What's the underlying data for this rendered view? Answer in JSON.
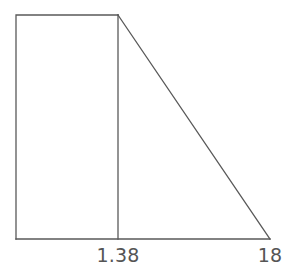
{
  "figure": {
    "name": "pressure-distribution-diagram",
    "background_color": "#ffffff",
    "line_color": "#595959",
    "line_width": 1.3,
    "label_color": "#555555",
    "width": 287,
    "height": 277
  },
  "labels": {
    "inner": "1.38",
    "outer": "18"
  },
  "chart_data": {
    "type": "area",
    "title": "",
    "xlabel": "",
    "ylabel": "",
    "x": [
      0,
      1.38,
      18
    ],
    "values": [
      1,
      1,
      0
    ],
    "tick_labels": [
      "1.38",
      "18"
    ],
    "tick_x": [
      1.38,
      18
    ],
    "xlim": [
      0,
      18
    ],
    "ylim": [
      0,
      1
    ],
    "grid": false,
    "legend": "none",
    "segments": [
      {
        "name": "uniform-block",
        "shape": "rectangle",
        "x_from": 0,
        "x_to": 1.38,
        "y_top": 1,
        "y_bottom": 0
      },
      {
        "name": "linear-taper",
        "shape": "triangle",
        "x_from": 1.38,
        "x_to": 18,
        "y_start": 1,
        "y_end": 0
      }
    ],
    "vertices_px": {
      "rect_top_left": [
        16,
        15
      ],
      "rect_top_right": [
        118,
        15
      ],
      "rect_bottom_left": [
        16,
        239
      ],
      "divider_bottom": [
        118,
        239
      ],
      "triangle_apex": [
        118,
        15
      ],
      "triangle_right": [
        270,
        239
      ]
    }
  }
}
